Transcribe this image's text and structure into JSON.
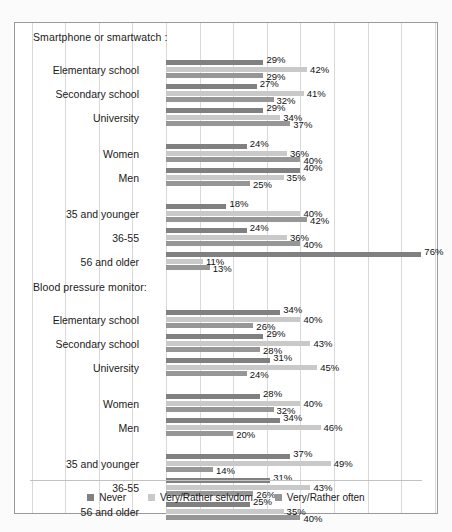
{
  "chart_data": {
    "type": "bar",
    "orientation": "horizontal",
    "title": "",
    "xlabel": "",
    "ylabel": "",
    "xlim": [
      0,
      80
    ],
    "grid": true,
    "gridline_step": 10,
    "legend_position": "bottom",
    "series": [
      {
        "name": "Never",
        "color": "#808080"
      },
      {
        "name": "Very/Rather selvdom",
        "color": "#c9c9c9"
      },
      {
        "name": "Very/Rather often",
        "color": "#969696"
      }
    ],
    "sections": [
      {
        "title": "Smartphone or smartwatch :",
        "groups": [
          {
            "name": "education",
            "categories": [
              "Elementary school",
              "Secondary school",
              "University"
            ],
            "values": [
              {
                "Never": 29,
                "Very/Rather selvdom": 42,
                "Very/Rather often": 29
              },
              {
                "Never": 27,
                "Very/Rather selvdom": 41,
                "Very/Rather often": 32
              },
              {
                "Never": 29,
                "Very/Rather selvdom": 34,
                "Very/Rather often": 37
              }
            ]
          },
          {
            "name": "gender",
            "categories": [
              "Women",
              "Men"
            ],
            "values": [
              {
                "Never": 24,
                "Very/Rather selvdom": 36,
                "Very/Rather often": 40
              },
              {
                "Never": 40,
                "Very/Rather selvdom": 35,
                "Very/Rather often": 25
              }
            ]
          },
          {
            "name": "age",
            "categories": [
              "35 and younger",
              "36-55",
              "56 and older"
            ],
            "values": [
              {
                "Never": 18,
                "Very/Rather selvdom": 40,
                "Very/Rather often": 42
              },
              {
                "Never": 24,
                "Very/Rather selvdom": 36,
                "Very/Rather often": 40
              },
              {
                "Never": 76,
                "Very/Rather selvdom": 11,
                "Very/Rather often": 13
              }
            ]
          }
        ]
      },
      {
        "title": "Blood pressure monitor:",
        "groups": [
          {
            "name": "education",
            "categories": [
              "Elementary school",
              "Secondary school",
              "University"
            ],
            "values": [
              {
                "Never": 34,
                "Very/Rather selvdom": 40,
                "Very/Rather often": 26
              },
              {
                "Never": 29,
                "Very/Rather selvdom": 43,
                "Very/Rather often": 28
              },
              {
                "Never": 31,
                "Very/Rather selvdom": 45,
                "Very/Rather often": 24
              }
            ]
          },
          {
            "name": "gender",
            "categories": [
              "Women",
              "Men"
            ],
            "values": [
              {
                "Never": 28,
                "Very/Rather selvdom": 40,
                "Very/Rather often": 32
              },
              {
                "Never": 34,
                "Very/Rather selvdom": 46,
                "Very/Rather often": 20
              }
            ]
          },
          {
            "name": "age",
            "categories": [
              "35 and younger",
              "36-55",
              "56 and older"
            ],
            "values": [
              {
                "Never": 37,
                "Very/Rather selvdom": 49,
                "Very/Rather often": 14
              },
              {
                "Never": 31,
                "Very/Rather selvdom": 43,
                "Very/Rather often": 26
              },
              {
                "Never": 25,
                "Very/Rather selvdom": 35,
                "Very/Rather often": 40
              }
            ]
          }
        ]
      }
    ]
  },
  "legend": {
    "items": [
      {
        "label": "Never",
        "color": "#808080"
      },
      {
        "label": "Very/Rather selvdom",
        "color": "#c9c9c9"
      },
      {
        "label": "Very/Rather often",
        "color": "#969696"
      }
    ]
  },
  "section_titles": {
    "smartphone": "Smartphone or smartwatch :",
    "blood_pressure": "Blood pressure monitor:"
  }
}
